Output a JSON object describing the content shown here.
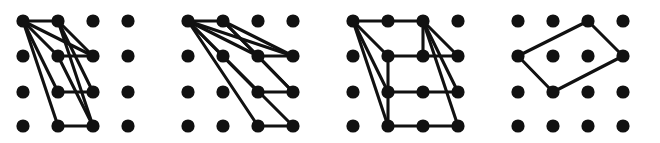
{
  "figure": {
    "title": "",
    "caption": "",
    "width": 660,
    "height": 143,
    "background_color": "#ffffff",
    "dot_color": "#111111",
    "edge_color": "#111111",
    "dot_radius": 6.6,
    "edge_width": 3.1,
    "panel_count": 4,
    "grid": {
      "rows": 4,
      "columns": 4,
      "column_x": [
        23,
        58,
        93,
        128
      ],
      "row_y": [
        21,
        56,
        92,
        126
      ]
    },
    "panel_origins_x": [
      0,
      165,
      330,
      495
    ],
    "panels": [
      {
        "name": "panel-1",
        "index": 1,
        "label": "",
        "dots": [
          [
            1,
            1
          ],
          [
            2,
            1
          ],
          [
            3,
            1
          ],
          [
            4,
            1
          ],
          [
            1,
            2
          ],
          [
            2,
            2
          ],
          [
            3,
            2
          ],
          [
            4,
            2
          ],
          [
            1,
            3
          ],
          [
            2,
            3
          ],
          [
            3,
            3
          ],
          [
            4,
            3
          ],
          [
            1,
            4
          ],
          [
            2,
            4
          ],
          [
            3,
            4
          ],
          [
            4,
            4
          ]
        ],
        "edges": [
          [
            [
              1,
              1
            ],
            [
              2,
              1
            ]
          ],
          [
            [
              1,
              1
            ],
            [
              2,
              2
            ]
          ],
          [
            [
              1,
              1
            ],
            [
              2,
              3
            ]
          ],
          [
            [
              1,
              1
            ],
            [
              2,
              4
            ]
          ],
          [
            [
              1,
              1
            ],
            [
              3,
              2
            ]
          ],
          [
            [
              2,
              1
            ],
            [
              3,
              2
            ]
          ],
          [
            [
              2,
              1
            ],
            [
              3,
              3
            ]
          ],
          [
            [
              2,
              1
            ],
            [
              3,
              4
            ]
          ],
          [
            [
              2,
              2
            ],
            [
              3,
              2
            ]
          ],
          [
            [
              2,
              3
            ],
            [
              3,
              3
            ]
          ],
          [
            [
              2,
              4
            ],
            [
              3,
              4
            ]
          ],
          [
            [
              2,
              2
            ],
            [
              3,
              4
            ]
          ]
        ]
      },
      {
        "name": "panel-2",
        "index": 2,
        "label": "",
        "dots": [
          [
            1,
            1
          ],
          [
            2,
            1
          ],
          [
            3,
            1
          ],
          [
            4,
            1
          ],
          [
            1,
            2
          ],
          [
            2,
            2
          ],
          [
            3,
            2
          ],
          [
            4,
            2
          ],
          [
            1,
            3
          ],
          [
            2,
            3
          ],
          [
            3,
            3
          ],
          [
            4,
            3
          ],
          [
            1,
            4
          ],
          [
            2,
            4
          ],
          [
            3,
            4
          ],
          [
            4,
            4
          ]
        ],
        "edges": [
          [
            [
              1,
              1
            ],
            [
              2,
              1
            ]
          ],
          [
            [
              1,
              1
            ],
            [
              2,
              2
            ]
          ],
          [
            [
              1,
              1
            ],
            [
              3,
              2
            ]
          ],
          [
            [
              1,
              1
            ],
            [
              3,
              3
            ]
          ],
          [
            [
              1,
              1
            ],
            [
              3,
              4
            ]
          ],
          [
            [
              1,
              1
            ],
            [
              4,
              2
            ]
          ],
          [
            [
              2,
              1
            ],
            [
              3,
              2
            ]
          ],
          [
            [
              2,
              1
            ],
            [
              4,
              2
            ]
          ],
          [
            [
              2,
              1
            ],
            [
              4,
              3
            ]
          ],
          [
            [
              2,
              2
            ],
            [
              4,
              4
            ]
          ],
          [
            [
              3,
              2
            ],
            [
              4,
              2
            ]
          ],
          [
            [
              3,
              3
            ],
            [
              4,
              3
            ]
          ],
          [
            [
              3,
              4
            ],
            [
              4,
              4
            ]
          ],
          [
            [
              3,
              2
            ],
            [
              4,
              3
            ]
          ]
        ]
      },
      {
        "name": "panel-3",
        "index": 3,
        "label": "",
        "edges": [
          [
            [
              1,
              1
            ],
            [
              2,
              1
            ]
          ],
          [
            [
              2,
              1
            ],
            [
              3,
              1
            ]
          ],
          [
            [
              1,
              1
            ],
            [
              2,
              2
            ]
          ],
          [
            [
              1,
              1
            ],
            [
              2,
              3
            ]
          ],
          [
            [
              1,
              1
            ],
            [
              2,
              4
            ]
          ],
          [
            [
              3,
              1
            ],
            [
              4,
              2
            ]
          ],
          [
            [
              3,
              1
            ],
            [
              4,
              3
            ]
          ],
          [
            [
              3,
              1
            ],
            [
              4,
              4
            ]
          ],
          [
            [
              3,
              1
            ],
            [
              3,
              2
            ]
          ],
          [
            [
              2,
              2
            ],
            [
              3,
              2
            ]
          ],
          [
            [
              3,
              2
            ],
            [
              4,
              2
            ]
          ],
          [
            [
              2,
              3
            ],
            [
              3,
              3
            ]
          ],
          [
            [
              3,
              3
            ],
            [
              4,
              3
            ]
          ],
          [
            [
              2,
              4
            ],
            [
              3,
              4
            ]
          ],
          [
            [
              3,
              4
            ],
            [
              4,
              4
            ]
          ],
          [
            [
              2,
              2
            ],
            [
              2,
              3
            ]
          ],
          [
            [
              2,
              3
            ],
            [
              2,
              4
            ]
          ]
        ],
        "dots": [
          [
            1,
            1
          ],
          [
            2,
            1
          ],
          [
            3,
            1
          ],
          [
            4,
            1
          ],
          [
            1,
            2
          ],
          [
            2,
            2
          ],
          [
            3,
            2
          ],
          [
            4,
            2
          ],
          [
            1,
            3
          ],
          [
            2,
            3
          ],
          [
            3,
            3
          ],
          [
            4,
            3
          ],
          [
            1,
            4
          ],
          [
            2,
            4
          ],
          [
            3,
            4
          ],
          [
            4,
            4
          ]
        ]
      },
      {
        "name": "panel-4",
        "index": 4,
        "label": "",
        "dots": [
          [
            1,
            1
          ],
          [
            2,
            1
          ],
          [
            3,
            1
          ],
          [
            4,
            1
          ],
          [
            1,
            2
          ],
          [
            2,
            2
          ],
          [
            3,
            2
          ],
          [
            4,
            2
          ],
          [
            1,
            3
          ],
          [
            2,
            3
          ],
          [
            3,
            3
          ],
          [
            4,
            3
          ],
          [
            1,
            4
          ],
          [
            2,
            4
          ],
          [
            3,
            4
          ],
          [
            4,
            4
          ]
        ],
        "edges": [
          [
            [
              3,
              1
            ],
            [
              4,
              2
            ]
          ],
          [
            [
              4,
              2
            ],
            [
              2,
              3
            ]
          ],
          [
            [
              2,
              3
            ],
            [
              1,
              2
            ]
          ],
          [
            [
              1,
              2
            ],
            [
              3,
              1
            ]
          ]
        ]
      }
    ]
  }
}
